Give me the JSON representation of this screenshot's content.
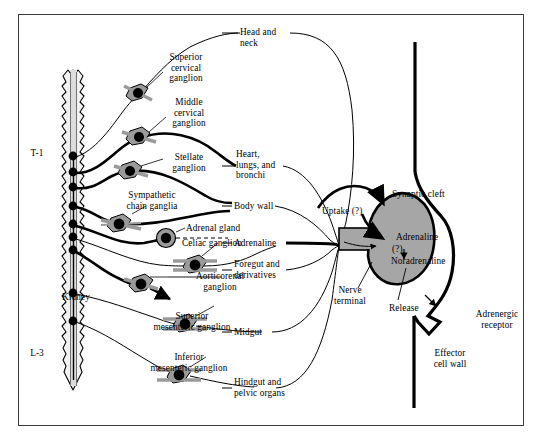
{
  "figure": {
    "type": "anatomical-diagram",
    "frame_color": "#3a3a3a",
    "ganglion_fill": "#9a9a9a",
    "terminal_fill": "#a6a6a6",
    "line_color": "#000000"
  },
  "spinal_cord": {
    "top_label": "T-1",
    "bottom_label": "L-3",
    "segment_dot_count": 9
  },
  "ganglia": [
    {
      "id": "superior-cervical",
      "label": "Superior\ncervical\nganglion"
    },
    {
      "id": "middle-cervical",
      "label": "Middle\ncervical\nganglion"
    },
    {
      "id": "stellate",
      "label": "Stellate\nganglion"
    },
    {
      "id": "sympathetic-chain",
      "label": "Sympathetic\nchain ganglia"
    },
    {
      "id": "celiac",
      "label": "Celiac ganglion"
    },
    {
      "id": "aorticorenal",
      "label": "Aorticorenal\nganglion"
    },
    {
      "id": "superior-mesenteric",
      "label": "Superior\nmesenteric ganglion"
    },
    {
      "id": "inferior-mesenteric",
      "label": "Inferior\nmesenteric ganglion"
    }
  ],
  "organs": {
    "adrenal_gland": "Adrenal gland",
    "kidney": "Kidney"
  },
  "targets": [
    {
      "id": "head-neck",
      "label": "Head and\nneck"
    },
    {
      "id": "heart-lungs-bronchi",
      "label": "Heart,\nlungs, and\nbronchi"
    },
    {
      "id": "body-wall",
      "label": "Body wall"
    },
    {
      "id": "adrenaline",
      "label": "Adrenaline"
    },
    {
      "id": "foregut",
      "label": "Foregut and\nderivatives"
    },
    {
      "id": "midgut",
      "label": "Midgut"
    },
    {
      "id": "hindgut",
      "label": "Hindgut and\npelvic organs"
    }
  ],
  "synapse": {
    "synaptic_cleft": "Synaptic cleft",
    "uptake": "Uptake (?)",
    "transmitter_top": "Adrenaline",
    "transmitter_mid": "(?)",
    "transmitter_bottom": "Noradrenaline",
    "nerve_terminal": "Nerve\nterminal",
    "release": "Release",
    "adrenergic_receptor": "Adrenergic\nreceptor",
    "effector_cell_wall": "Effector\ncell wall"
  }
}
